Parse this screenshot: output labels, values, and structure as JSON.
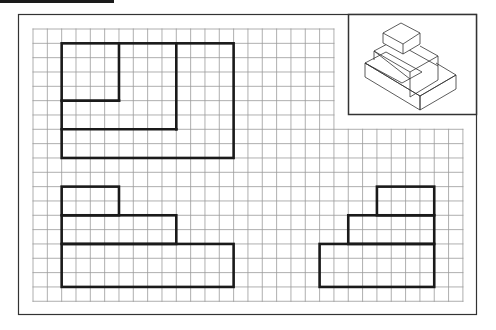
{
  "diagram": {
    "colors": {
      "grid": "#9a9a9a",
      "outline": "#1a1a1a",
      "frame": "#333333",
      "background": "#ffffff"
    },
    "grid": {
      "origin_x": 33,
      "origin_y": 29,
      "cell": 14.33,
      "cols_top": 21,
      "cols_full": 30,
      "rows_top": 7,
      "rows_total": 19
    },
    "views": [
      {
        "name": "top-view",
        "outline_cells": [
          2,
          1,
          14,
          9
        ],
        "lines": [
          [
            6,
            1,
            6,
            5
          ],
          [
            2,
            5,
            6,
            5
          ],
          [
            10,
            1,
            10,
            7
          ],
          [
            2,
            7,
            10,
            7
          ]
        ]
      },
      {
        "name": "front-view",
        "rects": [
          [
            2,
            11,
            6,
            13
          ],
          [
            2,
            13,
            10,
            15
          ],
          [
            2,
            15,
            14,
            18
          ]
        ]
      },
      {
        "name": "side-view",
        "rects": [
          [
            24,
            11,
            28,
            13
          ],
          [
            22,
            13,
            28,
            15
          ],
          [
            20,
            15,
            28,
            18
          ]
        ]
      }
    ],
    "isometric": {
      "label": "3-tier stepped block, isometric view"
    }
  }
}
